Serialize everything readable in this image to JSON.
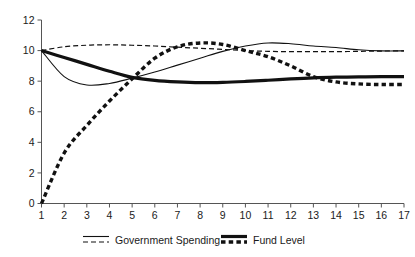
{
  "chart_data": {
    "type": "line",
    "title": "",
    "subtitle": "",
    "xlabel": "",
    "ylabel": "",
    "xlim": [
      1,
      17
    ],
    "ylim": [
      0,
      12
    ],
    "grid": false,
    "legend_position": "bottom",
    "x": [
      1,
      2,
      3,
      4,
      5,
      6,
      7,
      8,
      9,
      10,
      11,
      12,
      13,
      14,
      15,
      16,
      17
    ],
    "xticks": [
      "1",
      "2",
      "3",
      "4",
      "5",
      "6",
      "7",
      "8",
      "9",
      "10",
      "11",
      "12",
      "13",
      "14",
      "15",
      "16",
      "17"
    ],
    "yticks": [
      "0",
      "2",
      "4",
      "6",
      "8",
      "10",
      "12"
    ],
    "ytick_values": [
      0,
      2,
      4,
      6,
      8,
      10,
      12
    ],
    "series": [
      {
        "name": "Government Spending",
        "style": "thin-solid",
        "stroke_width": 1.1,
        "dash": "none",
        "color": "#111111",
        "values": [
          10.0,
          8.3,
          7.75,
          7.85,
          8.2,
          8.6,
          9.05,
          9.5,
          9.95,
          10.3,
          10.5,
          10.45,
          10.3,
          10.2,
          10.05,
          9.98,
          9.98
        ]
      },
      {
        "name": "Government Spending",
        "style": "thin-dashed",
        "stroke_width": 1.2,
        "dash": "5,3",
        "color": "#111111",
        "values": [
          10.0,
          10.25,
          10.35,
          10.38,
          10.35,
          10.3,
          10.22,
          10.15,
          10.08,
          10.0,
          9.95,
          9.93,
          9.93,
          9.93,
          9.95,
          9.97,
          9.98
        ]
      },
      {
        "name": "Fund Level",
        "style": "thick-solid",
        "stroke_width": 3.2,
        "dash": "none",
        "color": "#111111",
        "values": [
          10.0,
          9.55,
          9.1,
          8.65,
          8.25,
          8.05,
          7.95,
          7.9,
          7.92,
          7.98,
          8.06,
          8.15,
          8.22,
          8.26,
          8.28,
          8.3,
          8.3
        ]
      },
      {
        "name": "Fund Level",
        "style": "thick-dashed",
        "stroke_width": 3.4,
        "dash": "4.5,3.2",
        "color": "#111111",
        "values": [
          0.0,
          3.3,
          5.1,
          6.7,
          8.15,
          9.5,
          10.25,
          10.5,
          10.4,
          10.0,
          9.6,
          9.0,
          8.3,
          7.95,
          7.82,
          7.78,
          7.78
        ]
      }
    ],
    "legend": [
      {
        "label": "Government Spending",
        "keys": [
          "thin-solid",
          "thin-dashed"
        ]
      },
      {
        "label": "Fund Level",
        "keys": [
          "thick-solid",
          "thick-dashed"
        ]
      }
    ]
  }
}
